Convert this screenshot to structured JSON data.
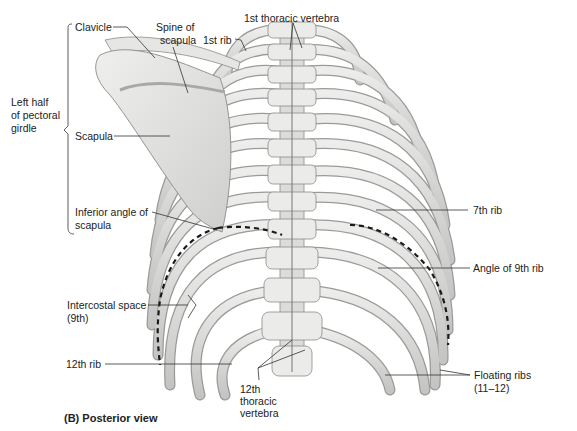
{
  "figure": {
    "caption": "(B)  Posterior view",
    "colors": {
      "bone_fill": "#e4e4e2",
      "bone_shade": "#bdbdbb",
      "bone_outline": "#8a8a88",
      "dashed_line": "#1a1a1a",
      "text": "#222222",
      "background": "#ffffff"
    },
    "labels": {
      "clavicle": "Clavicle",
      "spine_of_scapula_1": "Spine of",
      "spine_of_scapula_2": "scapula",
      "first_thoracic_vertebra": "1st thoracic vertebra",
      "first_rib": "1st rib",
      "left_half_1": "Left half",
      "left_half_2": "of pectoral",
      "left_half_3": "girdle",
      "scapula": "Scapula",
      "inferior_angle_1": "Inferior angle of",
      "inferior_angle_2": "scapula",
      "seventh_rib": "7th rib",
      "angle_9th_rib": "Angle of 9th rib",
      "intercostal_1": "Intercostal space",
      "intercostal_2": "(9th)",
      "twelfth_rib": "12th rib",
      "twelfth_vertebra_1": "12th",
      "twelfth_vertebra_2": "thoracic",
      "twelfth_vertebra_3": "vertebra",
      "floating_ribs_1": "Floating ribs",
      "floating_ribs_2": "(11–12)"
    }
  }
}
